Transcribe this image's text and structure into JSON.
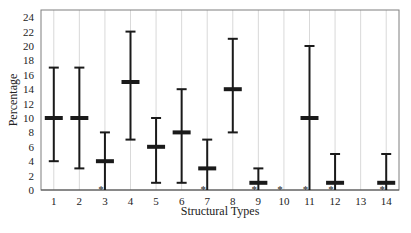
{
  "chart_data": {
    "type": "errorbar",
    "title": "",
    "xlabel": "Structural Types",
    "ylabel": "Percentage",
    "ylim": [
      0,
      25
    ],
    "yticks": [
      0,
      2,
      4,
      6,
      8,
      10,
      12,
      14,
      16,
      18,
      20,
      22,
      24
    ],
    "grid": "vertical gridlines at each category",
    "categories": [
      "1",
      "2",
      "3",
      "4",
      "5",
      "6",
      "7",
      "8",
      "9",
      "10",
      "11",
      "12",
      "13",
      "14"
    ],
    "series": [
      {
        "name": "Percentage",
        "mean": [
          10,
          10,
          4,
          15,
          6,
          8,
          3,
          14,
          1,
          null,
          10,
          1,
          null,
          1
        ],
        "low": [
          4,
          3,
          0,
          7,
          1,
          1,
          0,
          8,
          0,
          null,
          0,
          0,
          null,
          0
        ],
        "high": [
          17,
          17,
          8,
          22,
          10,
          14,
          7,
          21,
          3,
          null,
          20,
          5,
          null,
          5
        ]
      }
    ],
    "annotations": [
      {
        "category": "3",
        "marker": "*"
      },
      {
        "category": "7",
        "marker": "*"
      },
      {
        "category": "9",
        "marker": "*"
      },
      {
        "category": "10",
        "marker": "*"
      },
      {
        "category": "11",
        "marker": "*"
      },
      {
        "category": "12",
        "marker": "*"
      },
      {
        "category": "14",
        "marker": "*"
      }
    ],
    "colors": {
      "bars": "#1a1a1a",
      "grid": "#d9d9d9",
      "frame": "#7f7f7f"
    }
  }
}
